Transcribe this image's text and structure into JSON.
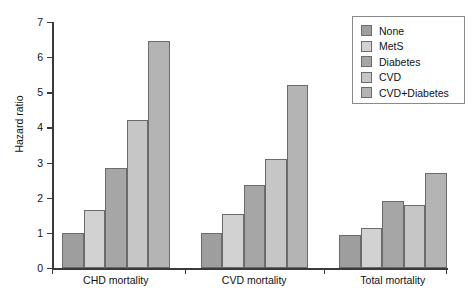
{
  "chart_data": {
    "type": "bar",
    "title": "",
    "xlabel": "",
    "ylabel": "Hazard ratio",
    "categories": [
      "CHD mortality",
      "CVD mortality",
      "Total mortality"
    ],
    "series": [
      {
        "name": "None",
        "color": "#9e9e9e",
        "values": [
          1.0,
          1.0,
          0.95
        ]
      },
      {
        "name": "MetS",
        "color": "#d2d2d2",
        "values": [
          1.65,
          1.55,
          1.15
        ]
      },
      {
        "name": "Diabetes",
        "color": "#a6a6a6",
        "values": [
          2.85,
          2.35,
          1.9
        ]
      },
      {
        "name": "CVD",
        "color": "#c6c6c6",
        "values": [
          4.2,
          3.1,
          1.78
        ]
      },
      {
        "name": "CVD+Diabetes",
        "color": "#b4b4b4",
        "values": [
          6.45,
          5.2,
          2.7
        ]
      }
    ],
    "ylim": [
      0,
      7
    ],
    "yticks": [
      "0",
      "1",
      "2",
      "3",
      "4",
      "5",
      "6",
      "7"
    ],
    "grid": false,
    "legend_position": "top-right",
    "legend_entries": [
      "None",
      "MetS",
      "Diabetes",
      "CVD",
      "CVD+Diabetes"
    ]
  },
  "axis": {
    "y_label": "Hazard ratio"
  }
}
